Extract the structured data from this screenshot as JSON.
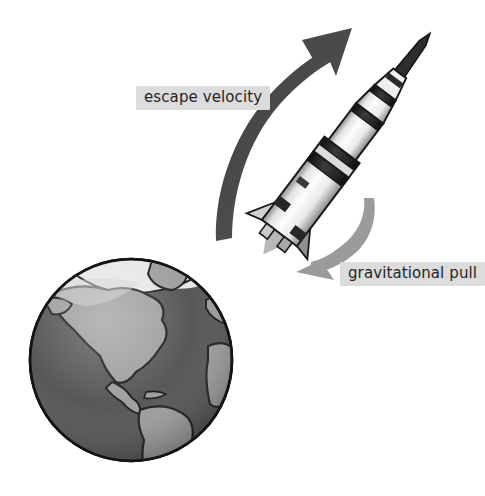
{
  "figure": {
    "kind": "science-diagram",
    "background_color": "#ffffff",
    "style": "grayscale-illustration",
    "labels": {
      "escape_velocity": "escape velocity",
      "gravitational_pull": "gravitational pull"
    },
    "label_style": {
      "background_color": "#dcdcdc",
      "text_color": "#262626"
    },
    "arrows": [
      {
        "name": "escape-velocity-arrow",
        "label": "escape velocity",
        "direction": "up-right",
        "curve": "concave-left",
        "color": "#4a4a4a",
        "weight": "thick",
        "head_position": [
          338,
          38
        ],
        "tail_position": [
          216,
          240
        ]
      },
      {
        "name": "gravitational-pull-arrow",
        "label": "gravitational pull",
        "direction": "down-left",
        "curve": "concave-right",
        "color": "#9b9b9b",
        "weight": "medium",
        "head_position": [
          300,
          272
        ],
        "tail_position": [
          374,
          198
        ]
      }
    ],
    "rocket": {
      "name": "saturn-v-rocket",
      "tilt_degrees": 37,
      "tip_position": [
        448,
        36
      ],
      "base_position": [
        236,
        262
      ],
      "body_color": "#f2f2f2",
      "band_color": "#2b2b2b",
      "shadow_color": "#b8b8b8",
      "outline_color": "#1a1a1a",
      "stages": [
        "escape-tower",
        "command-module",
        "third-stage",
        "second-stage",
        "first-stage"
      ],
      "marking_text": "USA"
    },
    "earth": {
      "name": "earth-globe",
      "center": [
        131,
        360
      ],
      "radius": 101,
      "ocean_color": "#4f4f4f",
      "land_color": "#9a9a9a",
      "ice_color": "#e6e6e6",
      "outline_color": "#141414",
      "continents_shown": "Americas"
    }
  }
}
